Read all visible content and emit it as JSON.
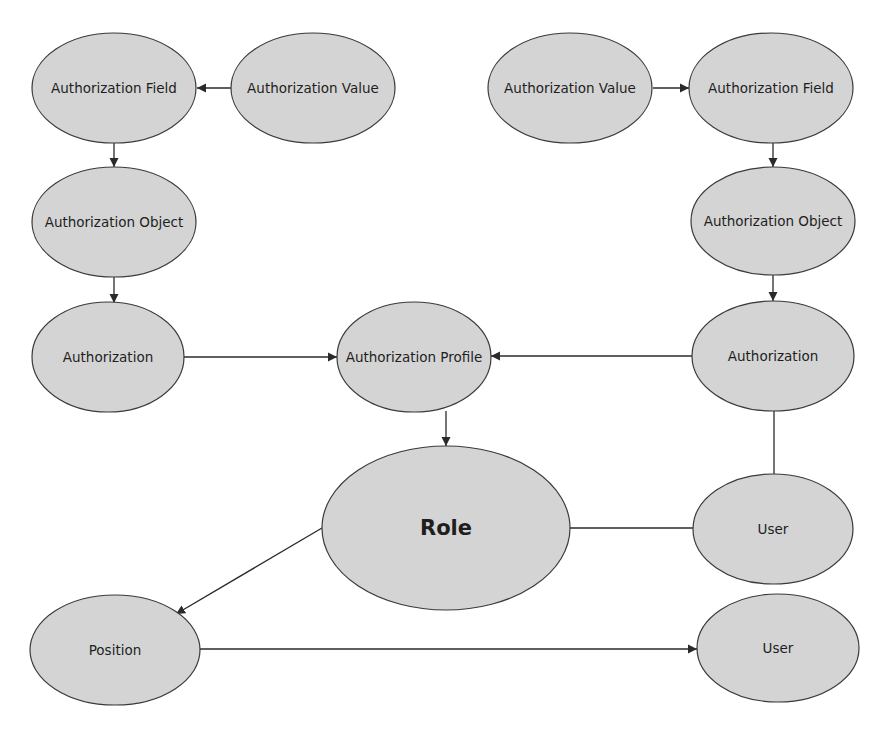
{
  "diagram": {
    "colors": {
      "node_fill": "#d4d4d4",
      "node_stroke": "#3a3a3a",
      "edge": "#2a2a2a",
      "text": "#1e1e1e",
      "background": "#ffffff"
    },
    "nodes": [
      {
        "id": "auth-field-left",
        "label": "Authorization Field",
        "cx": 114,
        "cy": 88,
        "rx": 82,
        "ry": 55
      },
      {
        "id": "auth-value-left",
        "label": "Authorization Value",
        "cx": 313,
        "cy": 88,
        "rx": 82,
        "ry": 55
      },
      {
        "id": "auth-object-left",
        "label": "Authorization Object",
        "cx": 114,
        "cy": 222,
        "rx": 82,
        "ry": 55
      },
      {
        "id": "authorization-left",
        "label": "Authorization",
        "cx": 108,
        "cy": 357,
        "rx": 76,
        "ry": 55
      },
      {
        "id": "auth-profile",
        "label": "Authorization Profile",
        "cx": 414,
        "cy": 357,
        "rx": 77,
        "ry": 55
      },
      {
        "id": "auth-value-right",
        "label": "Authorization Value",
        "cx": 570,
        "cy": 88,
        "rx": 82,
        "ry": 55
      },
      {
        "id": "auth-field-right",
        "label": "Authorization Field",
        "cx": 771,
        "cy": 88,
        "rx": 82,
        "ry": 55
      },
      {
        "id": "auth-object-right",
        "label": "Authorization Object",
        "cx": 773,
        "cy": 221,
        "rx": 82,
        "ry": 54
      },
      {
        "id": "authorization-right",
        "label": "Authorization",
        "cx": 773,
        "cy": 356,
        "rx": 81,
        "ry": 55
      },
      {
        "id": "role",
        "label": "Role",
        "cx": 446,
        "cy": 528,
        "rx": 124,
        "ry": 82,
        "big": true
      },
      {
        "id": "user-right",
        "label": "User",
        "cx": 773,
        "cy": 529,
        "rx": 80,
        "ry": 55
      },
      {
        "id": "position",
        "label": "Position",
        "cx": 115,
        "cy": 650,
        "rx": 85,
        "ry": 55
      },
      {
        "id": "user-bottom",
        "label": "User",
        "cx": 778,
        "cy": 648,
        "rx": 81,
        "ry": 54
      }
    ],
    "edges": [
      {
        "from": "auth-value-left",
        "to": "auth-field-left",
        "x1": 231,
        "y1": 88,
        "x2": 197,
        "y2": 88,
        "arrow": true
      },
      {
        "from": "auth-field-left",
        "to": "auth-object-left",
        "x1": 114,
        "y1": 143,
        "x2": 114,
        "y2": 167,
        "arrow": true
      },
      {
        "from": "auth-object-left",
        "to": "authorization-left",
        "x1": 114,
        "y1": 277,
        "x2": 114,
        "y2": 303,
        "arrow": true
      },
      {
        "from": "authorization-left",
        "to": "auth-profile",
        "x1": 184,
        "y1": 357,
        "x2": 337,
        "y2": 357,
        "arrow": true
      },
      {
        "from": "auth-value-right",
        "to": "auth-field-right",
        "x1": 653,
        "y1": 88,
        "x2": 689,
        "y2": 88,
        "arrow": true
      },
      {
        "from": "auth-field-right",
        "to": "auth-object-right",
        "x1": 773,
        "y1": 143,
        "x2": 773,
        "y2": 167,
        "arrow": true
      },
      {
        "from": "auth-object-right",
        "to": "authorization-right",
        "x1": 773,
        "y1": 275,
        "x2": 773,
        "y2": 301,
        "arrow": true
      },
      {
        "from": "authorization-right",
        "to": "auth-profile",
        "x1": 692,
        "y1": 356,
        "x2": 491,
        "y2": 356,
        "arrow": true
      },
      {
        "from": "auth-profile",
        "to": "role",
        "x1": 446,
        "y1": 411,
        "x2": 446,
        "y2": 446,
        "arrow": true
      },
      {
        "from": "authorization-right",
        "to": "user-right",
        "x1": 774,
        "y1": 410,
        "x2": 774,
        "y2": 474,
        "arrow": false
      },
      {
        "from": "role",
        "to": "user-right",
        "x1": 570,
        "y1": 528,
        "x2": 693,
        "y2": 528,
        "arrow": false
      },
      {
        "from": "role",
        "to": "position",
        "x1": 322,
        "y1": 528,
        "x2": 176,
        "y2": 614,
        "arrow": true
      },
      {
        "from": "position",
        "to": "user-bottom",
        "x1": 200,
        "y1": 649,
        "x2": 697,
        "y2": 649,
        "arrow": true
      }
    ]
  }
}
